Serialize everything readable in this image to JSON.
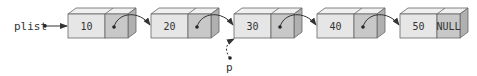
{
  "diagram": {
    "type": "singly-linked-list",
    "head_pointer": {
      "label": "plist",
      "points_to_node": 0
    },
    "cursor_pointer": {
      "label": "p",
      "points_to_node": 2,
      "style": "dashed"
    },
    "nodes": [
      {
        "value": "10",
        "next": "pointer"
      },
      {
        "value": "20",
        "next": "pointer"
      },
      {
        "value": "30",
        "next": "pointer"
      },
      {
        "value": "40",
        "next": "pointer"
      },
      {
        "value": "50",
        "next": "NULL"
      }
    ],
    "colors": {
      "data_face": "#e6e6e6",
      "pointer_face": "#c8c8c8",
      "top_face": "#f0f0f0",
      "side_face": "#b0b0b0",
      "stroke": "#666666",
      "arrow": "#333333"
    }
  }
}
